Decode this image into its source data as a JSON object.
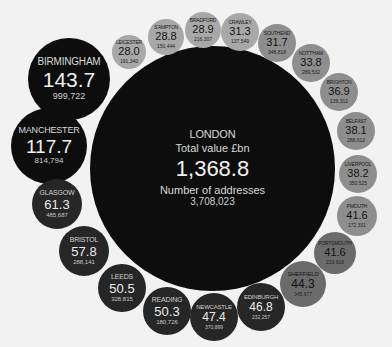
{
  "colors": {
    "background": "#f2f2f2",
    "tier_black": "#0d0d0d",
    "tier_dark": "#262626",
    "tier_mid": "#6b6b6b",
    "tier_light": "#8e8e8e",
    "tier_lightest": "#a8a8a8"
  },
  "center": {
    "name": "LONDON",
    "value_label": "Total value £bn",
    "value": "1,368.8",
    "addresses_label": "Number of addresses",
    "addresses": "3,708,023"
  },
  "chart_data": {
    "type": "bubble",
    "title": "",
    "value_unit": "£bn",
    "center": {
      "city": "LONDON",
      "value": 1368.8,
      "addresses": 3708023
    },
    "series": [
      {
        "city": "BIRMINGHAM",
        "value": 143.7,
        "addresses": "999,722"
      },
      {
        "city": "MANCHESTER",
        "value": 117.7,
        "addresses": "814,794"
      },
      {
        "city": "GLASGOW",
        "value": 61.3,
        "addresses": "485,687"
      },
      {
        "city": "BRISTOL",
        "value": 57.8,
        "addresses": "288,141"
      },
      {
        "city": "LEEDS",
        "value": 50.5,
        "addresses": "328,815"
      },
      {
        "city": "READING",
        "value": 50.3,
        "addresses": "180,726"
      },
      {
        "city": "NEWCASTLE",
        "value": 47.4,
        "addresses": "370,899"
      },
      {
        "city": "EDINBURGH",
        "value": 46.8,
        "addresses": "232,257"
      },
      {
        "city": "SHEFFIELD",
        "value": 44.3,
        "addresses": "345,677"
      },
      {
        "city": "PORTSMOUTH",
        "value": 41.6,
        "addresses": "219,916"
      },
      {
        "city": "PMOUTH",
        "value": 41.6,
        "addresses": "172,331"
      },
      {
        "city": "LIVERPOOL",
        "value": 38.2,
        "addresses": "350,525"
      },
      {
        "city": "BELFAST",
        "value": 38.1,
        "addresses": "288,612"
      },
      {
        "city": "BRIGHTON",
        "value": 36.9,
        "addresses": "139,312"
      },
      {
        "city": "NOTT'HAM",
        "value": 33.8,
        "addresses": "289,532"
      },
      {
        "city": "SOUTHEND",
        "value": 31.7,
        "addresses": "348,818"
      },
      {
        "city": "CRAWLEY",
        "value": 31.3,
        "addresses": "137,549"
      },
      {
        "city": "BRADFORD",
        "value": 28.9,
        "addresses": "216,307"
      },
      {
        "city": "S'AMPTON",
        "value": 28.8,
        "addresses": "150,444"
      },
      {
        "city": "LEICESTER",
        "value": 28.0,
        "addresses": "191,340"
      }
    ]
  },
  "bubbles": [
    {
      "name": "BIRMINGHAM",
      "value": "143.7",
      "addresses": "999,722",
      "cx": 69,
      "cy": 79,
      "r": 41,
      "tier": "black",
      "nf": 10,
      "vf": 21,
      "af": 9
    },
    {
      "name": "MANCHESTER",
      "value": "117.7",
      "addresses": "814,794",
      "cx": 49,
      "cy": 146,
      "r": 38,
      "tier": "black",
      "nf": 9,
      "vf": 19,
      "af": 8
    },
    {
      "name": "GLASGOW",
      "value": "61.3",
      "addresses": "485,687",
      "cx": 57,
      "cy": 204,
      "r": 25,
      "tier": "dark",
      "nf": 7,
      "vf": 13,
      "af": 6
    },
    {
      "name": "BRISTOL",
      "value": "57.8",
      "addresses": "288,141",
      "cx": 84,
      "cy": 251,
      "r": 25,
      "tier": "dark",
      "nf": 7,
      "vf": 13,
      "af": 6
    },
    {
      "name": "LEEDS",
      "value": "50.5",
      "addresses": "328,815",
      "cx": 122,
      "cy": 288,
      "r": 24,
      "tier": "dark",
      "nf": 7,
      "vf": 13,
      "af": 6
    },
    {
      "name": "READING",
      "value": "50.3",
      "addresses": "180,726",
      "cx": 167,
      "cy": 311,
      "r": 24,
      "tier": "dark",
      "nf": 7,
      "vf": 13,
      "af": 6
    },
    {
      "name": "NEWCASTLE",
      "value": "47.4",
      "addresses": "370,899",
      "cx": 214,
      "cy": 317,
      "r": 24,
      "tier": "dark",
      "nf": 6,
      "vf": 12,
      "af": 5
    },
    {
      "name": "EDINBURGH",
      "value": "46.8",
      "addresses": "232,257",
      "cx": 261,
      "cy": 307,
      "r": 24,
      "tier": "dark",
      "nf": 6,
      "vf": 12,
      "af": 5
    },
    {
      "name": "SHEFFIELD",
      "value": "44.3",
      "addresses": "345,677",
      "cx": 303,
      "cy": 284,
      "r": 23,
      "tier": "mid",
      "nf": 6,
      "vf": 12,
      "af": 5
    },
    {
      "name": "PORTSMOUTH",
      "value": "41.6",
      "addresses": "219,916",
      "cx": 335,
      "cy": 253,
      "r": 21,
      "tier": "mid",
      "nf": 5,
      "vf": 11,
      "af": 5
    },
    {
      "name": "PMOUTH",
      "value": "41.6",
      "addresses": "172,331",
      "cx": 357,
      "cy": 216,
      "r": 20,
      "tier": "light",
      "nf": 5,
      "vf": 11,
      "af": 5
    },
    {
      "name": "LIVERPOOL",
      "value": "38.2",
      "addresses": "350,525",
      "cx": 358,
      "cy": 174,
      "r": 19,
      "tier": "light",
      "nf": 5,
      "vf": 11,
      "af": 5
    },
    {
      "name": "BELFAST",
      "value": "38.1",
      "addresses": "288,612",
      "cx": 356,
      "cy": 131,
      "r": 19,
      "tier": "light",
      "nf": 5,
      "vf": 11,
      "af": 5
    },
    {
      "name": "BRIGHTON",
      "value": "36.9",
      "addresses": "139,312",
      "cx": 339,
      "cy": 92,
      "r": 19,
      "tier": "light",
      "nf": 5,
      "vf": 11,
      "af": 5
    },
    {
      "name": "NOTT'HAM",
      "value": "33.8",
      "addresses": "289,532",
      "cx": 311,
      "cy": 63,
      "r": 19,
      "tier": "light",
      "nf": 5,
      "vf": 11,
      "af": 5
    },
    {
      "name": "SOUTHEND",
      "value": "31.7",
      "addresses": "348,818",
      "cx": 277,
      "cy": 43,
      "r": 19,
      "tier": "light",
      "nf": 5,
      "vf": 11,
      "af": 5
    },
    {
      "name": "CRAWLEY",
      "value": "31.3",
      "addresses": "137,549",
      "cx": 240,
      "cy": 32,
      "r": 19,
      "tier": "lightest",
      "nf": 5,
      "vf": 11,
      "af": 5
    },
    {
      "name": "BRADFORD",
      "value": "28.9",
      "addresses": "216,307",
      "cx": 203,
      "cy": 30,
      "r": 18,
      "tier": "lightest",
      "nf": 5,
      "vf": 11,
      "af": 5
    },
    {
      "name": "S'AMPTON",
      "value": "28.8",
      "addresses": "150,444",
      "cx": 166,
      "cy": 37,
      "r": 18,
      "tier": "lightest",
      "nf": 5,
      "vf": 11,
      "af": 5
    },
    {
      "name": "LEICESTER",
      "value": "28.0",
      "addresses": "191,340",
      "cx": 129,
      "cy": 52,
      "r": 17,
      "tier": "lightest",
      "nf": 5,
      "vf": 11,
      "af": 5
    }
  ]
}
